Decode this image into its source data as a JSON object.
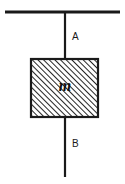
{
  "figure": {
    "background_color": "#ffffff",
    "stroke_color": "#1a1a1a",
    "labels": {
      "upper_string": "A",
      "lower_string": "B",
      "mass": "m"
    },
    "elements": {
      "ceiling": {
        "name": "ceiling-line",
        "x1": 5,
        "y1": 12,
        "x2": 120,
        "y2": 12,
        "thickness": 3
      },
      "string_a": {
        "name": "string-a",
        "x1": 65,
        "y1": 12,
        "x2": 65,
        "y2": 59,
        "thickness": 2
      },
      "block": {
        "name": "mass-block",
        "x": 30,
        "y": 58,
        "width": 69,
        "height": 60,
        "border_thickness": 2,
        "fill": "hatch-45",
        "hatch_spacing": 4,
        "hatch_angle_deg": 45
      },
      "string_b": {
        "name": "string-b",
        "x1": 65,
        "y1": 118,
        "x2": 65,
        "y2": 177,
        "thickness": 2
      }
    }
  }
}
